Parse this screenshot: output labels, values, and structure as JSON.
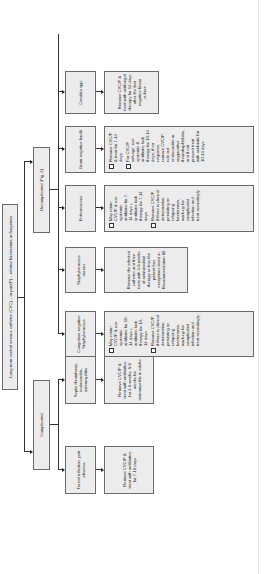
{
  "diagram": {
    "root": "Long-term central venous catheter (CVC) – or port(P) – related bacteremia or fungemia",
    "branches": [
      {
        "label": "Complicated",
        "children": [
          {
            "label": "Tunnel infection, port abscess",
            "treatment": [
              "Remove CVC/P & treat with antibiotics for 7-10 days"
            ]
          },
          {
            "label": "Septic thrombosis, endocarditis, osteomyelitis",
            "treatment": [
              "Remove CVC/P & treat with antibiotics for 4-6 weeks; 6-8 weeks for osteomyelitis in adults"
            ]
          }
        ]
      },
      {
        "label": "Uncomplicated (Fig. 2)",
        "children": [
          {
            "label": "Coagulase-negative Staphylococcus",
            "treatment": [
              "May retain CVC/P & use systemic antibiotic for 10-14 days + antibiotic lock therapy for 10-14 days",
              "Remove CVC/P if there is clinical deterioration, persisting or relapsing bacteremia, work-up for complicated infection and treat accordingly"
            ]
          },
          {
            "label": "Staphylococcus aureus",
            "treatment": [
              "Remove the infected catheter and then treat with 4-6 weeks of antimicrobial therapy unless the patient has exceptions listed in Recommendation 80"
            ]
          },
          {
            "label": "Enterococcus",
            "treatment": [
              "May retain CVC/P & use systemic antibiotic for 7-14 days + antibiotic lock therapy for 7-14 days",
              "Remove CVC/P if there is clinical deterioration, persisting or relapsing bacteremia, work-up for complicated infection and treat accordingly"
            ]
          },
          {
            "label": "Gram-negative bacilli",
            "treatment": [
              "Remove CVC/P & treat for 7-14 days",
              "For CVC/P salvage, use systemic & antibiotic lock therapy for 10-14 days; if no response, remove CVC/P, rule out endocarditis or suppurative thrombophlebitis, and if not present treat with antibiotic for 10-14 days"
            ]
          },
          {
            "label": "Candida spp.",
            "treatment": [
              "Remove CVC/P & treat with antifungal therapy for 14 days after the first negative blood culture"
            ]
          }
        ]
      }
    ]
  },
  "colors": {
    "box_fill": "#ececec",
    "box_border": "#6a6a6a",
    "line": "#333333"
  }
}
